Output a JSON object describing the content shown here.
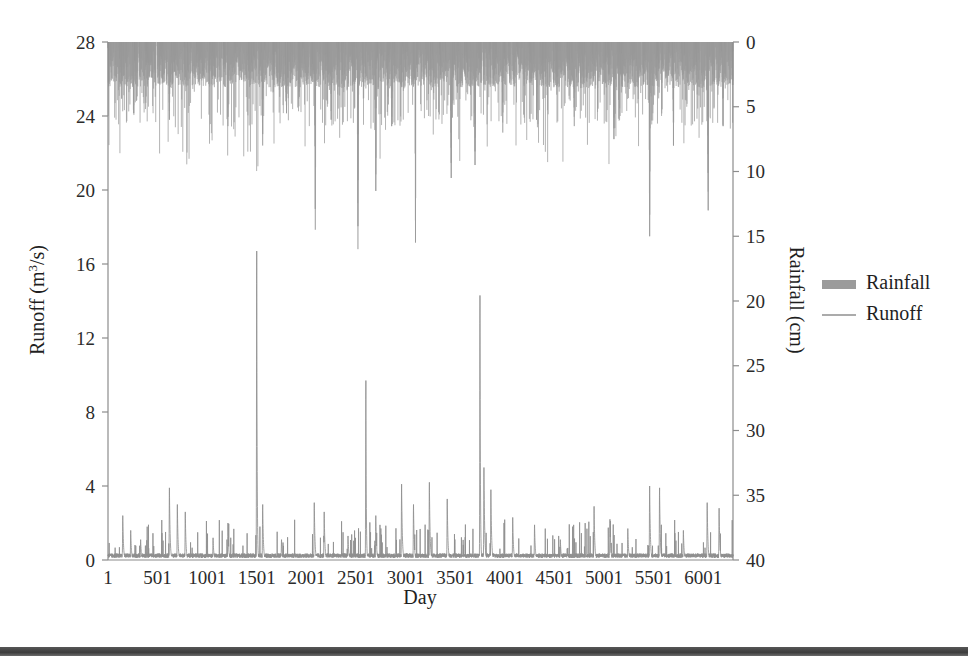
{
  "figure": {
    "background_color": "#ffffff",
    "series_color": "#9a9a9a",
    "rainfall_color": "#9b9b9b",
    "runoff_color": "#8f8f8f",
    "axis_color": "#8c8c8c",
    "text_color": "#1f1f1f"
  },
  "legend": {
    "position": "right",
    "items": [
      {
        "label": "Rainfall",
        "marker": "bar-swatch",
        "color": "#9b9b9b"
      },
      {
        "label": "Runoff",
        "marker": "line-swatch",
        "color": "#8f8f8f"
      }
    ]
  },
  "chart_data": {
    "type": "line",
    "title": "",
    "subtitle": "",
    "xlabel": "Day",
    "ylabel": "Runoff (m3/s)",
    "ylabel_display": "Runoff (m",
    "ylabel_sup": "3",
    "ylabel_tail": "/s)",
    "y2label_display": "Rainfall (cm)",
    "grid": false,
    "xlim": [
      1,
      6300
    ],
    "ylim": [
      0,
      28
    ],
    "y2lim": [
      0,
      40
    ],
    "y2_inverted": true,
    "xticks": [
      1,
      501,
      1001,
      1501,
      2001,
      2501,
      3001,
      3501,
      4001,
      4501,
      5001,
      5501,
      6001
    ],
    "xticklabels": [
      "1",
      "501",
      "1001",
      "1501",
      "2001",
      "2501",
      "3001",
      "3501",
      "4001",
      "4501",
      "5001",
      "5501",
      "6001"
    ],
    "yticks": [
      0,
      4,
      8,
      12,
      16,
      20,
      24,
      28
    ],
    "yticklabels": [
      "0",
      "4",
      "8",
      "12",
      "16",
      "20",
      "24",
      "28"
    ],
    "y2ticks": [
      0,
      5,
      10,
      15,
      20,
      25,
      30,
      35,
      40
    ],
    "y2ticklabels": [
      "0",
      "5",
      "10",
      "15",
      "20",
      "25",
      "30",
      "35",
      "40"
    ],
    "series": [
      {
        "name": "Rainfall",
        "axis": "y2",
        "units": "cm",
        "render": "bars-from-top",
        "color": "#9b9b9b",
        "description": "Daily rainfall plotted downward from the top axis; most days 0-4 cm with frequent spikes to 5-10 cm and occasional extremes near 14-16 cm.",
        "typical_range": [
          0,
          4
        ],
        "max_value": 16,
        "notable_peaks": [
          {
            "day": 260,
            "value": 5.5
          },
          {
            "day": 620,
            "value": 6.0
          },
          {
            "day": 1210,
            "value": 6.5
          },
          {
            "day": 1560,
            "value": 8.0
          },
          {
            "day": 1800,
            "value": 5.5
          },
          {
            "day": 2090,
            "value": 14.5
          },
          {
            "day": 2250,
            "value": 6.0
          },
          {
            "day": 2520,
            "value": 16.0
          },
          {
            "day": 2700,
            "value": 11.5
          },
          {
            "day": 2860,
            "value": 6.5
          },
          {
            "day": 3100,
            "value": 15.5
          },
          {
            "day": 3460,
            "value": 10.5
          },
          {
            "day": 3700,
            "value": 9.5
          },
          {
            "day": 3980,
            "value": 7.0
          },
          {
            "day": 4320,
            "value": 6.0
          },
          {
            "day": 4700,
            "value": 6.5
          },
          {
            "day": 5100,
            "value": 7.5
          },
          {
            "day": 5460,
            "value": 15.0
          },
          {
            "day": 5700,
            "value": 8.0
          },
          {
            "day": 6050,
            "value": 13.0
          },
          {
            "day": 6200,
            "value": 6.5
          }
        ]
      },
      {
        "name": "Runoff",
        "axis": "y",
        "units": "m3/s",
        "render": "spiky-line",
        "color": "#8f8f8f",
        "description": "Daily streamflow with a low baseflow near 0-0.5 and sharp storm-event peaks; largest events reach 16.7, 14.3 and 9.7 m3/s.",
        "baseflow": 0.25,
        "max_value": 16.7,
        "notable_peaks": [
          {
            "day": 150,
            "value": 2.4
          },
          {
            "day": 230,
            "value": 1.6
          },
          {
            "day": 330,
            "value": 1.1
          },
          {
            "day": 620,
            "value": 3.9
          },
          {
            "day": 700,
            "value": 3.0
          },
          {
            "day": 780,
            "value": 2.6
          },
          {
            "day": 1060,
            "value": 1.2
          },
          {
            "day": 1210,
            "value": 2.0
          },
          {
            "day": 1500,
            "value": 16.7
          },
          {
            "day": 1560,
            "value": 3.0
          },
          {
            "day": 1750,
            "value": 1.1
          },
          {
            "day": 2080,
            "value": 3.1
          },
          {
            "day": 2180,
            "value": 2.6
          },
          {
            "day": 2420,
            "value": 1.3
          },
          {
            "day": 2600,
            "value": 9.7
          },
          {
            "day": 2700,
            "value": 2.4
          },
          {
            "day": 2960,
            "value": 4.1
          },
          {
            "day": 3080,
            "value": 3.0
          },
          {
            "day": 3240,
            "value": 4.2
          },
          {
            "day": 3420,
            "value": 3.3
          },
          {
            "day": 3750,
            "value": 14.3
          },
          {
            "day": 3790,
            "value": 5.0
          },
          {
            "day": 3860,
            "value": 3.8
          },
          {
            "day": 4080,
            "value": 2.3
          },
          {
            "day": 4300,
            "value": 1.9
          },
          {
            "day": 4560,
            "value": 1.1
          },
          {
            "day": 4900,
            "value": 2.9
          },
          {
            "day": 5060,
            "value": 2.2
          },
          {
            "day": 5240,
            "value": 1.7
          },
          {
            "day": 5460,
            "value": 4.0
          },
          {
            "day": 5560,
            "value": 3.9
          },
          {
            "day": 5800,
            "value": 1.6
          },
          {
            "day": 6040,
            "value": 3.1
          },
          {
            "day": 6160,
            "value": 2.8
          }
        ]
      }
    ]
  }
}
